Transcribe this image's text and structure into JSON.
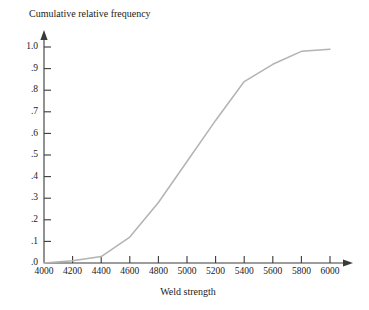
{
  "chart_data": {
    "type": "line",
    "title": "Cumulative relative frequency",
    "xlabel": "Weld strength",
    "ylabel": "Cumulative relative frequency",
    "xlim": [
      4000,
      6000
    ],
    "ylim": [
      0.0,
      1.0
    ],
    "grid": false,
    "legend": null,
    "line_color": "#b3b3b3",
    "axis_color": "#3a3a3a",
    "xticks": [
      4000,
      4200,
      4400,
      4600,
      4800,
      5000,
      5200,
      5400,
      5600,
      5800,
      6000
    ],
    "xtick_labels": [
      "4000",
      "4200",
      "4400",
      "4600",
      "4800",
      "5000",
      "5200",
      "5400",
      "5600",
      "5800",
      "6000"
    ],
    "yticks": [
      0.0,
      0.1,
      0.2,
      0.3,
      0.4,
      0.5,
      0.6,
      0.7,
      0.8,
      0.9,
      1.0
    ],
    "ytick_labels": [
      ".0",
      ".1",
      ".2",
      ".3",
      ".4",
      ".5",
      ".6",
      ".7",
      ".8",
      ".9",
      "1.0"
    ],
    "x": [
      4000,
      4200,
      4400,
      4600,
      4800,
      5000,
      5200,
      5400,
      5600,
      5800,
      6000
    ],
    "values": [
      0.0,
      0.01,
      0.03,
      0.12,
      0.28,
      0.47,
      0.66,
      0.84,
      0.92,
      0.98,
      0.99
    ],
    "series": [
      {
        "name": "Cumulative relative frequency",
        "values": [
          0.0,
          0.01,
          0.03,
          0.12,
          0.28,
          0.47,
          0.66,
          0.84,
          0.92,
          0.98,
          0.99
        ]
      }
    ]
  }
}
